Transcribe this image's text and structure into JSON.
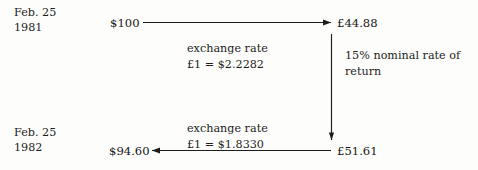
{
  "diagram": {
    "background_color": "#fdfdfb",
    "ink_color": "#1d1d1d"
  },
  "dates": {
    "start": {
      "month_day": "Feb. 25",
      "year": "1981"
    },
    "end": {
      "month_day": "Feb. 25",
      "year": "1982"
    }
  },
  "amounts": {
    "usd_start": "$100",
    "gbp_start": "£44.88",
    "gbp_end": "£51.61",
    "usd_end": "$94.60"
  },
  "rates": {
    "top": {
      "label": "exchange rate",
      "value": "£1 = $2.2282"
    },
    "bottom": {
      "label": "exchange rate",
      "value": "£1 = $1.8330"
    }
  },
  "return_note": {
    "line1": "15% nominal rate of",
    "line2": "return"
  },
  "arrows": [
    {
      "name": "usd-to-gbp-arrow",
      "direction": "right"
    },
    {
      "name": "gbp-growth-arrow",
      "direction": "down"
    },
    {
      "name": "gbp-to-usd-arrow",
      "direction": "left"
    }
  ]
}
